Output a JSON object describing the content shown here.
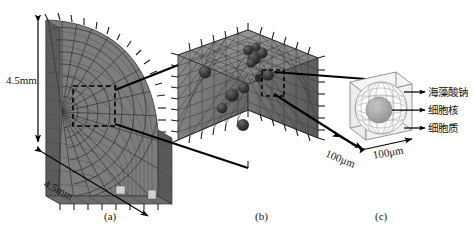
{
  "figure": {
    "kind": "multiscale-fem-model-diagram",
    "background_color": "#ffffff",
    "line_color": "#000000",
    "mesh_color": "#6e6e6e"
  },
  "panels": [
    {
      "id": "a",
      "caption": "(a)",
      "description": "quarter-sector curved structured mesh",
      "dimensions": [
        {
          "name": "height",
          "value": "4.5mm"
        },
        {
          "name": "width",
          "value": "4.5mm"
        }
      ]
    },
    {
      "id": "b",
      "caption": "(b)",
      "description": "tetrahedral mesh cube with embedded cells"
    },
    {
      "id": "c",
      "caption": "(c)",
      "description": "single cell unit cube",
      "dimensions": [
        {
          "name": "depth",
          "value": "100μm"
        },
        {
          "name": "width",
          "value": "100μm"
        }
      ],
      "legend": [
        {
          "key": "alginate",
          "label": "海藻酸钠"
        },
        {
          "key": "nucleus",
          "label": "细胞核"
        },
        {
          "key": "cytoplasm",
          "label": "细胞质"
        }
      ]
    }
  ]
}
